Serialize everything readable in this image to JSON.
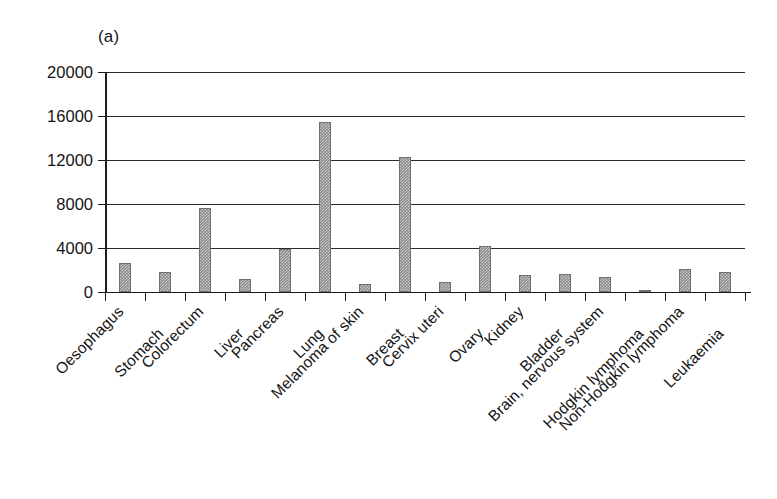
{
  "figure": {
    "panel_label": "(a)",
    "bar_color": "#8a8a8a",
    "axis_color": "#1c1c1c"
  },
  "chart_data": {
    "type": "bar",
    "title": "(a)",
    "xlabel": "",
    "ylabel": "",
    "ylim": [
      0,
      20000
    ],
    "yticks": [
      0,
      4000,
      8000,
      12000,
      16000,
      20000
    ],
    "ytick_labels": [
      "0",
      "4000",
      "8000",
      "12000",
      "16000",
      "20000"
    ],
    "grid": true,
    "legend": null,
    "categories": [
      "Oesophagus",
      "Stomach",
      "Colorectum",
      "Liver",
      "Pancreas",
      "Lung",
      "Melanoma of skin",
      "Breast",
      "Cervix uteri",
      "Ovary",
      "Kidney",
      "Bladder",
      "Brain, nervous system",
      "Hodgkin lymphoma",
      "Non-Hodgkin lymphoma",
      "Leukaemia"
    ],
    "values": [
      2600,
      1850,
      7600,
      1200,
      3950,
      15500,
      750,
      12300,
      900,
      4150,
      1550,
      1600,
      1400,
      150,
      2100,
      1850
    ]
  }
}
